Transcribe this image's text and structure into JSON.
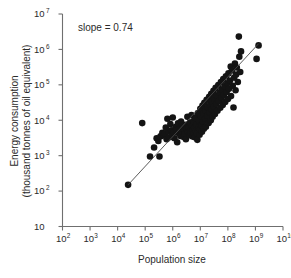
{
  "figure": {
    "background": "#ffffff",
    "annotation": "slope = 0.74"
  },
  "axes": {
    "x_title": "Population size",
    "y_title_line1": "Energy consumption",
    "y_title_line2": "(thousand tonnes of oil equivalent)",
    "x_tick_labels": [
      "10",
      "10",
      "10",
      "10",
      "10",
      "10",
      "10",
      "10",
      "10"
    ],
    "x_tick_exponents": [
      "2",
      "3",
      "4",
      "5",
      "6",
      "7",
      "8",
      "9",
      "10"
    ],
    "y_tick_labels": [
      "10",
      "10",
      "10",
      "10",
      "10",
      "10",
      "10"
    ],
    "y_tick_exponents": [
      "",
      "2",
      "3",
      "4",
      "5",
      "6",
      "7"
    ]
  },
  "chart_data": {
    "type": "scatter",
    "title": "",
    "xlabel": "Population size",
    "ylabel": "Energy consumption (thousand tonnes of oil equivalent)",
    "xscale": "log",
    "yscale": "log",
    "xlim": [
      100,
      10000000000
    ],
    "ylim": [
      10,
      10000000
    ],
    "grid": false,
    "legend": null,
    "annotations": [
      {
        "text": "slope = 0.74",
        "x": 100000,
        "y": 3500000
      }
    ],
    "fit_line": {
      "slope": 0.74,
      "label": "slope = 0.74",
      "x_start": 24000,
      "y_start": 150,
      "x_end": 1300000000,
      "y_end": 1450000
    },
    "marker": {
      "shape": "circle",
      "color": "#141414",
      "size_px": 6.6
    },
    "n_points": 131,
    "points": [
      [
        24000,
        150
      ],
      [
        78000,
        8300
      ],
      [
        150000,
        950
      ],
      [
        210000,
        1700
      ],
      [
        260000,
        3100
      ],
      [
        300000,
        2600
      ],
      [
        330000,
        950
      ],
      [
        360000,
        3500
      ],
      [
        420000,
        4400
      ],
      [
        470000,
        3700
      ],
      [
        520000,
        4200
      ],
      [
        560000,
        6200
      ],
      [
        600000,
        2900
      ],
      [
        640000,
        11000
      ],
      [
        700000,
        4800
      ],
      [
        760000,
        3300
      ],
      [
        820000,
        7800
      ],
      [
        880000,
        5200
      ],
      [
        950000,
        3900
      ],
      [
        1000000,
        12000
      ],
      [
        1100000,
        4600
      ],
      [
        1150000,
        3100
      ],
      [
        1250000,
        6400
      ],
      [
        1350000,
        5100
      ],
      [
        1450000,
        2400
      ],
      [
        1550000,
        8200
      ],
      [
        1650000,
        4300
      ],
      [
        1750000,
        5600
      ],
      [
        1900000,
        3600
      ],
      [
        2000000,
        9200
      ],
      [
        2100000,
        4900
      ],
      [
        2250000,
        6800
      ],
      [
        2400000,
        3400
      ],
      [
        2550000,
        5300
      ],
      [
        2700000,
        4100
      ],
      [
        2850000,
        7400
      ],
      [
        3000000,
        2900
      ],
      [
        3200000,
        5800
      ],
      [
        3400000,
        12500
      ],
      [
        3600000,
        4600
      ],
      [
        3800000,
        6300
      ],
      [
        4000000,
        3800
      ],
      [
        4200000,
        8600
      ],
      [
        4400000,
        5100
      ],
      [
        4600000,
        4200
      ],
      [
        4800000,
        14000
      ],
      [
        5000000,
        6900
      ],
      [
        5200000,
        3500
      ],
      [
        5400000,
        5400
      ],
      [
        5600000,
        9500
      ],
      [
        5800000,
        4300
      ],
      [
        6000000,
        6100
      ],
      [
        6300000,
        3300
      ],
      [
        6600000,
        11500
      ],
      [
        6900000,
        5000
      ],
      [
        7200000,
        7600
      ],
      [
        7500000,
        4200
      ],
      [
        7800000,
        2800
      ],
      [
        8200000,
        16000
      ],
      [
        8600000,
        6200
      ],
      [
        9000000,
        9800
      ],
      [
        9400000,
        3900
      ],
      [
        9800000,
        5500
      ],
      [
        10000000,
        21000
      ],
      [
        10500000,
        13000
      ],
      [
        11000000,
        7200
      ],
      [
        11500000,
        4700
      ],
      [
        12000000,
        26000
      ],
      [
        12500000,
        9000
      ],
      [
        13000000,
        15500
      ],
      [
        13500000,
        5800
      ],
      [
        14000000,
        31000
      ],
      [
        15000000,
        11000
      ],
      [
        15500000,
        19000
      ],
      [
        16000000,
        6600
      ],
      [
        17000000,
        38000
      ],
      [
        18000000,
        13500
      ],
      [
        19000000,
        23000
      ],
      [
        20000000,
        8400
      ],
      [
        21000000,
        46000
      ],
      [
        22000000,
        16500
      ],
      [
        23000000,
        28000
      ],
      [
        24000000,
        10000
      ],
      [
        25000000,
        56000
      ],
      [
        26000000,
        20000
      ],
      [
        27000000,
        34000
      ],
      [
        28000000,
        12500
      ],
      [
        30000000,
        68000
      ],
      [
        31000000,
        24000
      ],
      [
        32000000,
        41000
      ],
      [
        34000000,
        15000
      ],
      [
        36000000,
        82000
      ],
      [
        38000000,
        29000
      ],
      [
        40000000,
        50000
      ],
      [
        42000000,
        18500
      ],
      [
        45000000,
        99000
      ],
      [
        47000000,
        35000
      ],
      [
        50000000,
        61000
      ],
      [
        53000000,
        22500
      ],
      [
        56000000,
        120000
      ],
      [
        59000000,
        43000
      ],
      [
        62000000,
        74000
      ],
      [
        65000000,
        27000
      ],
      [
        68000000,
        145000
      ],
      [
        72000000,
        52000
      ],
      [
        76000000,
        90000
      ],
      [
        80000000,
        33000
      ],
      [
        85000000,
        175000
      ],
      [
        90000000,
        63000
      ],
      [
        95000000,
        110000
      ],
      [
        100000000,
        40000
      ],
      [
        105000000,
        210000
      ],
      [
        110000000,
        77000
      ],
      [
        120000000,
        133000
      ],
      [
        127000000,
        330000
      ],
      [
        130000000,
        48000
      ],
      [
        140000000,
        255000
      ],
      [
        150000000,
        94000
      ],
      [
        160000000,
        23000
      ],
      [
        170000000,
        160000
      ],
      [
        180000000,
        400000
      ],
      [
        190000000,
        70000
      ],
      [
        200000000,
        195000
      ],
      [
        210000000,
        310000
      ],
      [
        230000000,
        120000
      ],
      [
        250000000,
        2300000
      ],
      [
        260000000,
        620000
      ],
      [
        280000000,
        230000
      ],
      [
        300000000,
        880000
      ],
      [
        1100000000,
        540000
      ],
      [
        1300000000,
        1300000
      ]
    ]
  }
}
